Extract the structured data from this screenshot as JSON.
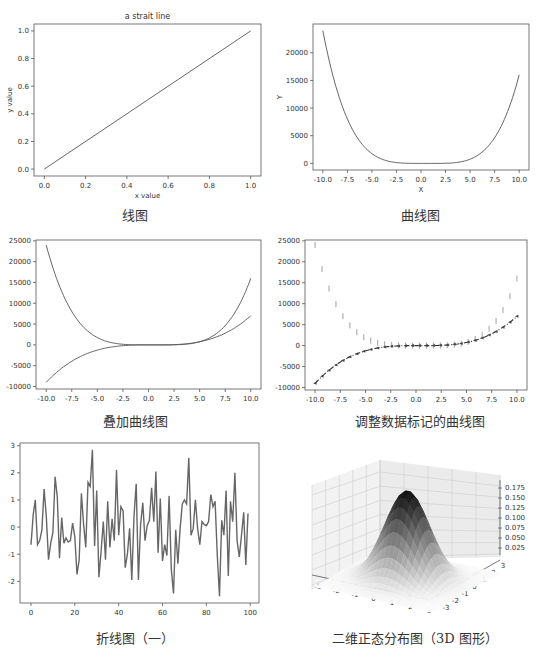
{
  "captions": {
    "c1": "线图",
    "c2": "曲线图",
    "c3": "叠加曲线图",
    "c4": "调整数据标记的曲线图",
    "c5": "折线图（一）",
    "c6": "二维正态分布图（3D 图形）"
  },
  "chart_data": [
    {
      "type": "line",
      "title": "a strait line",
      "xlabel": "x value",
      "ylabel": "y value",
      "x": [
        0.0,
        1.0
      ],
      "series": [
        {
          "name": "line",
          "values": [
            0.0,
            1.0
          ]
        }
      ],
      "xticks": [
        "0.0",
        "0.2",
        "0.4",
        "0.6",
        "0.8",
        "1.0"
      ],
      "yticks": [
        "0.0",
        "0.2",
        "0.4",
        "0.6",
        "0.8",
        "1.0"
      ],
      "xlim": [
        -0.05,
        1.05
      ],
      "ylim": [
        -0.05,
        1.05
      ],
      "grid": false
    },
    {
      "type": "line",
      "title": "",
      "xlabel": "X",
      "ylabel": "Y",
      "x": [
        -10,
        -7.5,
        -5,
        -2.5,
        0,
        2.5,
        5,
        7.5,
        10
      ],
      "series": [
        {
          "name": "curve",
          "values": [
            24000,
            9600,
            1750,
            140,
            0,
            15,
            750,
            6400,
            16000
          ]
        }
      ],
      "xticks": [
        "-10.0",
        "-7.5",
        "-5.0",
        "-2.5",
        "0.0",
        "2.5",
        "5.0",
        "7.5",
        "10.0"
      ],
      "yticks": [
        "0",
        "5000",
        "10000",
        "15000",
        "20000"
      ],
      "xlim": [
        -11,
        11
      ],
      "ylim": [
        -1200,
        25200
      ],
      "grid": false
    },
    {
      "type": "line",
      "title": "",
      "xlabel": "",
      "ylabel": "",
      "x": [
        -10,
        -7.5,
        -5,
        -2.5,
        0,
        2.5,
        5,
        7.5,
        10
      ],
      "series": [
        {
          "name": "quartic",
          "values": [
            24000,
            9600,
            1750,
            140,
            0,
            15,
            750,
            6400,
            16000
          ]
        },
        {
          "name": "cubic",
          "values": [
            -9000,
            -3900,
            -1250,
            -190,
            0,
            60,
            750,
            2800,
            7000
          ]
        }
      ],
      "xticks": [
        "-10.0",
        "-7.5",
        "-5.0",
        "-2.5",
        "0.0",
        "2.5",
        "5.0",
        "7.5",
        "10.0"
      ],
      "yticks": [
        "-10000",
        "-5000",
        "0",
        "5000",
        "10000",
        "15000",
        "20000",
        "25000"
      ],
      "xlim": [
        -11,
        11
      ],
      "ylim": [
        -10600,
        25200
      ],
      "grid": false
    },
    {
      "type": "line",
      "title": "",
      "xlabel": "",
      "ylabel": "",
      "x": [
        -10,
        -7.5,
        -5,
        -2.5,
        0,
        2.5,
        5,
        7.5,
        10
      ],
      "series": [
        {
          "name": "quartic (vline markers)",
          "marker": "|",
          "linestyle": "none",
          "values": [
            24000,
            9600,
            1750,
            140,
            0,
            15,
            750,
            6400,
            16000
          ]
        },
        {
          "name": "cubic (dash-dot)",
          "marker": "<",
          "linestyle": "-.",
          "values": [
            -9000,
            -3900,
            -1250,
            -190,
            0,
            60,
            750,
            2800,
            7000
          ]
        }
      ],
      "xticks": [
        "-10.0",
        "-7.5",
        "-5.0",
        "-2.5",
        "0.0",
        "2.5",
        "5.0",
        "7.5",
        "10.0"
      ],
      "yticks": [
        "-10000",
        "-5000",
        "0",
        "5000",
        "10000",
        "15000",
        "20000",
        "25000"
      ],
      "xlim": [
        -11,
        11
      ],
      "ylim": [
        -10600,
        25200
      ],
      "grid": false
    },
    {
      "type": "line",
      "title": "",
      "xlabel": "",
      "ylabel": "",
      "x_range": [
        0,
        99
      ],
      "series": [
        {
          "name": "random walk noise",
          "values": [
            -0.65,
            0.45,
            1.0,
            -0.65,
            -0.5,
            -0.1,
            1.4,
            0.4,
            -1.2,
            -0.6,
            -0.2,
            1.85,
            1.1,
            -1.15,
            0.35,
            -0.6,
            -0.4,
            -0.55,
            -0.5,
            0.15,
            -0.35,
            -1.75,
            -1.2,
            1.25,
            0.1,
            -0.75,
            1.65,
            1.5,
            2.85,
            -0.7,
            1.35,
            -1.85,
            -0.9,
            0.2,
            -1.2,
            0.95,
            -0.75,
            0.3,
            -0.5,
            2.1,
            -0.3,
            0.75,
            0.6,
            -1.5,
            -1.0,
            -0.05,
            -1.95,
            0.4,
            1.6,
            -1.95,
            0.1,
            0.9,
            -0.5,
            0.05,
            0.25,
            1.45,
            0.2,
            2.05,
            -0.95,
            1.05,
            -1.25,
            -0.65,
            -1.05,
            1.15,
            -1.55,
            -2.45,
            -0.1,
            -1.35,
            -0.05,
            0.85,
            1.0,
            0.85,
            2.55,
            -0.3,
            -0.05,
            1.0,
            -0.05,
            -0.65,
            0.2,
            0.1,
            0.05,
            0.2,
            1.2,
            0.75,
            0.95,
            -1.05,
            -2.55,
            0.25,
            -0.3,
            1.35,
            -1.8,
            0.95,
            0.2,
            2.0,
            -0.5,
            -1.1,
            -0.3,
            0.55,
            -1.4,
            0.5
          ]
        }
      ],
      "xticks": [
        "0",
        "20",
        "40",
        "60",
        "80",
        "100"
      ],
      "yticks": [
        "-2",
        "-1",
        "0",
        "1",
        "2",
        "3"
      ],
      "xlim": [
        -5,
        104
      ],
      "ylim": [
        -2.8,
        3.1
      ],
      "grid": false
    },
    {
      "type": "surface",
      "title": "",
      "description": "bivariate standard normal density surface, grayscale colormap",
      "xticks": [
        "-3",
        "-2",
        "-1",
        "0",
        "1",
        "2",
        "3"
      ],
      "yticks": [
        "-3",
        "-2",
        "-1",
        "0",
        "1",
        "2",
        "3"
      ],
      "zticks": [
        "0.025",
        "0.050",
        "0.075",
        "0.100",
        "0.125",
        "0.150",
        "0.175"
      ],
      "zmax": 0.159,
      "grid": true
    }
  ],
  "chart1": {
    "title": "a strait line",
    "xlabel": "x value",
    "ylabel": "y value",
    "xticks": [
      "0.0",
      "0.2",
      "0.4",
      "0.6",
      "0.8",
      "1.0"
    ],
    "yticks": [
      "0.0",
      "0.2",
      "0.4",
      "0.6",
      "0.8",
      "1.0"
    ]
  },
  "chart2": {
    "xlabel": "X",
    "ylabel": "Y",
    "xticks": [
      "-10.0",
      "-7.5",
      "-5.0",
      "-2.5",
      "0.0",
      "2.5",
      "5.0",
      "7.5",
      "10.0"
    ],
    "yticks": [
      "0",
      "5000",
      "10000",
      "15000",
      "20000"
    ]
  },
  "chart3": {
    "xticks": [
      "-10.0",
      "-7.5",
      "-5.0",
      "-2.5",
      "0.0",
      "2.5",
      "5.0",
      "7.5",
      "10.0"
    ],
    "yticks": [
      "-10000",
      "-5000",
      "0",
      "5000",
      "10000",
      "15000",
      "20000",
      "25000"
    ]
  },
  "chart5": {
    "xticks": [
      "0",
      "20",
      "40",
      "60",
      "80",
      "100"
    ],
    "yticks": [
      "-2",
      "-1",
      "0",
      "1",
      "2",
      "3"
    ]
  },
  "chart6": {
    "xticks": [
      "-3",
      "-2",
      "-1",
      "0",
      "1",
      "2",
      "3"
    ],
    "yticks": [
      "-3",
      "-2",
      "-1",
      "0",
      "1",
      "2",
      "3"
    ],
    "zticks": [
      "0.025",
      "0.050",
      "0.075",
      "0.100",
      "0.125",
      "0.150",
      "0.175"
    ]
  },
  "colors": {
    "line": "#555555",
    "axis": "#555555",
    "text": "#333333"
  }
}
